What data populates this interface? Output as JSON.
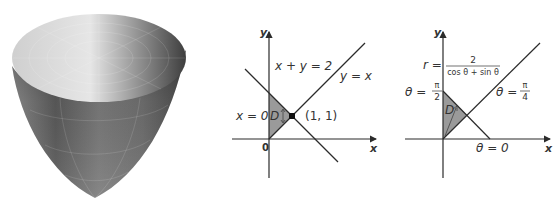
{
  "figure": {
    "panels": [
      {
        "id": "paraboloid",
        "description": "3D rendered paraboloid surface with grid lines"
      },
      {
        "id": "cartesian-region",
        "axis_x_label": "x",
        "axis_y_label": "y",
        "origin_label": "0",
        "line1_label": "x + y = 2",
        "line2_label": "y = x",
        "boundary_label": "x = 0",
        "region_label": "D",
        "point_label": "(1, 1)"
      },
      {
        "id": "polar-region",
        "axis_x_label": "x",
        "axis_y_label": "y",
        "r_prefix": "r =",
        "r_numerator": "2",
        "r_denominator": "cos θ + sin θ",
        "theta_vertical_prefix": "θ =",
        "theta_vertical_num": "π",
        "theta_vertical_den": "2",
        "theta_diag_prefix": "θ =",
        "theta_diag_num": "π",
        "theta_diag_den": "4",
        "theta_zero_label": "θ = 0",
        "region_label": "D"
      }
    ]
  },
  "colors": {
    "line": "#2b2b2b",
    "region_fill": "#9a9a9a",
    "text": "#333333"
  }
}
